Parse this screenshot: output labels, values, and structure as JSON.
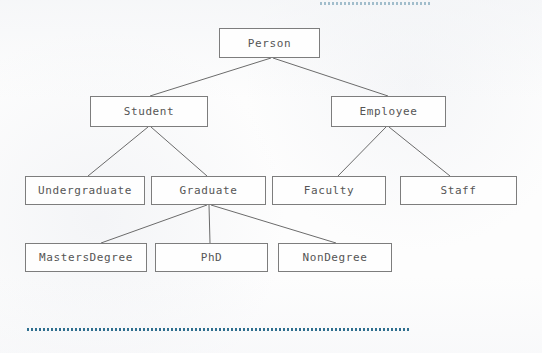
{
  "diagram": {
    "style": {
      "box_border_color": "#7d7d7d",
      "box_fill_color": "#fefefe",
      "text_color": "#555555",
      "edge_color": "#6b6b6b",
      "dotted_rule_color": "#2f6f8f",
      "page_background": "#fdfdfd"
    },
    "nodes": [
      {
        "id": "person",
        "label": "Person",
        "x": 219,
        "y": 28,
        "w": 101,
        "h": 30
      },
      {
        "id": "student",
        "label": "Student",
        "x": 90,
        "y": 96,
        "w": 118,
        "h": 31
      },
      {
        "id": "employee",
        "label": "Employee",
        "x": 331,
        "y": 96,
        "w": 115,
        "h": 31
      },
      {
        "id": "undergraduate",
        "label": "Undergraduate",
        "x": 25,
        "y": 176,
        "w": 120,
        "h": 29
      },
      {
        "id": "graduate",
        "label": "Graduate",
        "x": 151,
        "y": 176,
        "w": 115,
        "h": 29
      },
      {
        "id": "faculty",
        "label": "Faculty",
        "x": 272,
        "y": 176,
        "w": 114,
        "h": 29
      },
      {
        "id": "staff",
        "label": "Staff",
        "x": 400,
        "y": 176,
        "w": 117,
        "h": 29
      },
      {
        "id": "mastersdegree",
        "label": "MastersDegree",
        "x": 25,
        "y": 243,
        "w": 122,
        "h": 29
      },
      {
        "id": "phd",
        "label": "PhD",
        "x": 155,
        "y": 243,
        "w": 113,
        "h": 29
      },
      {
        "id": "nondegree",
        "label": "NonDegree",
        "x": 278,
        "y": 243,
        "w": 114,
        "h": 29
      }
    ],
    "edges": [
      {
        "from": "person",
        "to": "student",
        "x1": 271,
        "y1": 58,
        "x2": 150,
        "y2": 96
      },
      {
        "from": "person",
        "to": "employee",
        "x1": 273,
        "y1": 58,
        "x2": 388,
        "y2": 96
      },
      {
        "from": "student",
        "to": "undergraduate",
        "x1": 148,
        "y1": 127,
        "x2": 88,
        "y2": 176
      },
      {
        "from": "student",
        "to": "graduate",
        "x1": 151,
        "y1": 127,
        "x2": 207,
        "y2": 176
      },
      {
        "from": "employee",
        "to": "faculty",
        "x1": 386,
        "y1": 127,
        "x2": 338,
        "y2": 176
      },
      {
        "from": "employee",
        "to": "staff",
        "x1": 389,
        "y1": 127,
        "x2": 450,
        "y2": 176
      },
      {
        "from": "graduate",
        "to": "mastersdegree",
        "x1": 207,
        "y1": 205,
        "x2": 101,
        "y2": 243
      },
      {
        "from": "graduate",
        "to": "phd",
        "x1": 209,
        "y1": 205,
        "x2": 210,
        "y2": 243
      },
      {
        "from": "graduate",
        "to": "nondegree",
        "x1": 211,
        "y1": 205,
        "x2": 336,
        "y2": 243
      }
    ],
    "rules": [
      {
        "id": "top-dotted-rule",
        "x": 320,
        "y": 1,
        "w": 112,
        "opacity": 0.42
      },
      {
        "id": "bottom-dotted-rule",
        "x": 27,
        "y": 327,
        "w": 382,
        "opacity": 1
      }
    ]
  }
}
